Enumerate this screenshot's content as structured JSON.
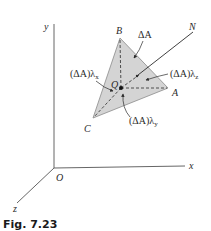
{
  "figure": {
    "caption": "Fig. 7.23",
    "colors": {
      "triangle_fill": "#d4d4d4",
      "triangle_edge": "#7a7a7a",
      "line": "#2b2b2b",
      "axis": "#555555"
    },
    "axes": {
      "origin_label": "O",
      "x_label": "x",
      "y_label": "y",
      "z_label": "z"
    },
    "vertices": {
      "a_label": "A",
      "b_label": "B",
      "c_label": "C"
    },
    "point_q_label": "Q",
    "normal_label": "N",
    "area_label": "ΔA",
    "projections": {
      "x": {
        "base": "(ΔA)λ",
        "sub": "x"
      },
      "y": {
        "base": "(ΔA)λ",
        "sub": "y"
      },
      "z": {
        "base": "(ΔA)λ",
        "sub": "z"
      }
    }
  }
}
